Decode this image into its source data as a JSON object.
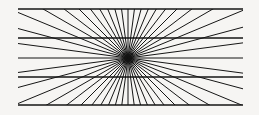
{
  "figure": {
    "name": "wundt-hering-illusion",
    "canvas": {
      "width": 259,
      "height": 115,
      "background_color": "#f6f5f3"
    },
    "stroke": {
      "color": "#151515",
      "ray_width": 1.0,
      "horizontal_width": 1.7,
      "linecap": "butt"
    },
    "center": {
      "x": 128,
      "y": 58
    },
    "rays": {
      "count": 48,
      "start_angle_deg": 0,
      "angle_step_deg": 7.5,
      "length": 300,
      "clipped_to_frame": true
    },
    "horizontal_lines": {
      "x_start": 18,
      "x_end": 243,
      "y_values": [
        9,
        38,
        77,
        105
      ]
    },
    "frame": {
      "left": 18,
      "right": 243,
      "top": 9,
      "bottom": 105
    }
  }
}
